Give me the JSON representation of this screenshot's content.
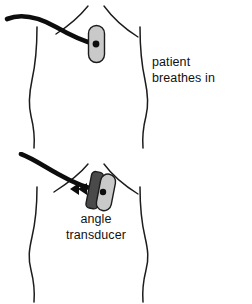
{
  "figure": {
    "background_color": "#ffffff",
    "width": 252,
    "height": 304
  },
  "colors": {
    "outline": "#1c1c1c",
    "cable": "#0d0d0d",
    "device_light_gray": "#c9c9c9",
    "device_dark_gray": "#4a4a4a",
    "text": "#111111"
  },
  "panels": [
    {
      "id": "top",
      "caption": "patient\nbreathes in",
      "torso_name": "patient-torso",
      "device_name": "angle-transducer-device",
      "device_state": "upright",
      "has_arrow": false,
      "has_device_label": false
    },
    {
      "id": "bottom",
      "caption": "patient\nholds breath in",
      "torso_name": "patient-torso",
      "device_name": "angle-transducer-device",
      "device_state": "tilted",
      "has_arrow": true,
      "arrow_direction": "left",
      "has_device_label": true,
      "device_label": "angle\ntransducer"
    }
  ]
}
